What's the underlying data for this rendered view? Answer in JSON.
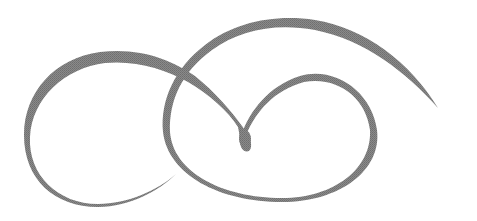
{
  "ornament": {
    "description": "Calligraphic swash flourish",
    "stroke_color": "#7f7f7f",
    "background": "#ffffff"
  }
}
